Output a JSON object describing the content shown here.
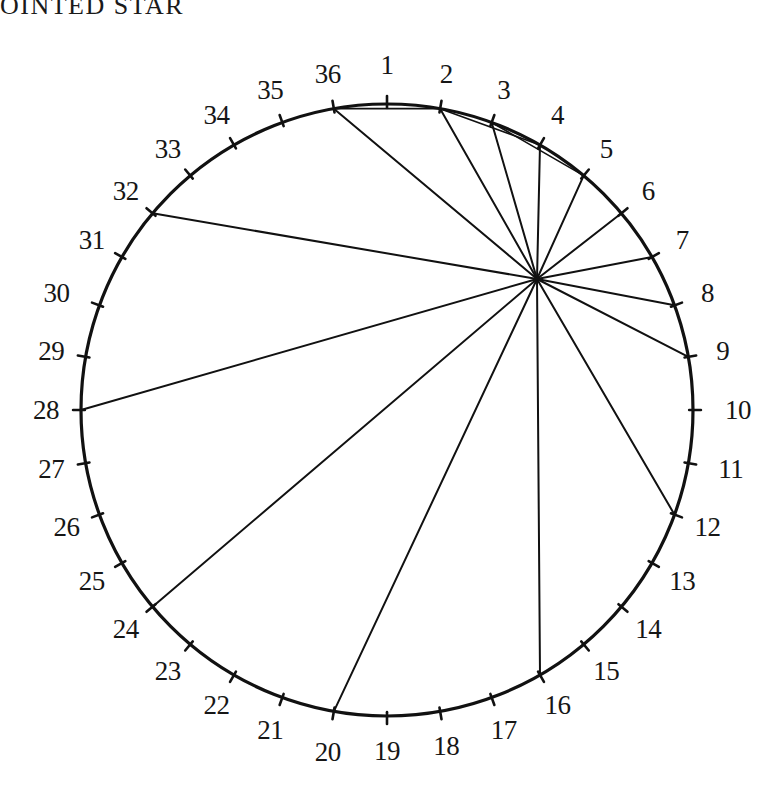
{
  "title": "OINTED STAR",
  "figure": {
    "name": "36-point-circle-chord-diagram",
    "point_count": 36,
    "labels": [
      "1",
      "2",
      "3",
      "4",
      "5",
      "6",
      "7",
      "8",
      "9",
      "10",
      "11",
      "12",
      "13",
      "14",
      "15",
      "16",
      "17",
      "18",
      "19",
      "20",
      "21",
      "22",
      "23",
      "24",
      "25",
      "26",
      "27",
      "28",
      "29",
      "30",
      "31",
      "32",
      "33",
      "34",
      "35",
      "36"
    ],
    "circle": {
      "cx": 387,
      "cy": 410,
      "r": 306,
      "stroke": "#111111",
      "stroke_width": 3.2
    },
    "tick": {
      "length": 11,
      "stroke": "#111111",
      "stroke_width": 2.6
    },
    "label_radius": 341,
    "node": {
      "x": 537,
      "y": 279,
      "name": "chord-convergence-node"
    },
    "chord_stroke": "#111111",
    "chord_stroke_width": 2.0,
    "chords_from_node": [
      36,
      2,
      3,
      4,
      5,
      6,
      7,
      8,
      9,
      12,
      16,
      20,
      24,
      28,
      32
    ],
    "chord_list": [
      {
        "from": "node",
        "to": 36
      },
      {
        "from": "node",
        "to": 2
      },
      {
        "from": "node",
        "to": 3
      },
      {
        "from": "node",
        "to": 4
      },
      {
        "from": "node",
        "to": 5
      },
      {
        "from": "node",
        "to": 6
      },
      {
        "from": "node",
        "to": 7
      },
      {
        "from": "node",
        "to": 8
      },
      {
        "from": "node",
        "to": 9
      },
      {
        "from": "node",
        "to": 12
      },
      {
        "from": "node",
        "to": 16
      },
      {
        "from": "node",
        "to": 20
      },
      {
        "from": "node",
        "to": 24
      },
      {
        "from": "node",
        "to": 28
      },
      {
        "from": "node",
        "to": 32
      }
    ],
    "arc_chords": [
      {
        "from": 36,
        "to": 2
      },
      {
        "from": 2,
        "to": 4
      },
      {
        "from": 3,
        "to": 5
      }
    ],
    "label_offsets": {
      "1": {
        "dx": 0,
        "dy": -4
      },
      "10": {
        "dx": 10,
        "dy": 0
      },
      "11": {
        "dx": 8,
        "dy": 0
      },
      "20": {
        "dx": 0,
        "dy": 6
      },
      "30": {
        "dx": -10,
        "dy": 0
      }
    }
  }
}
